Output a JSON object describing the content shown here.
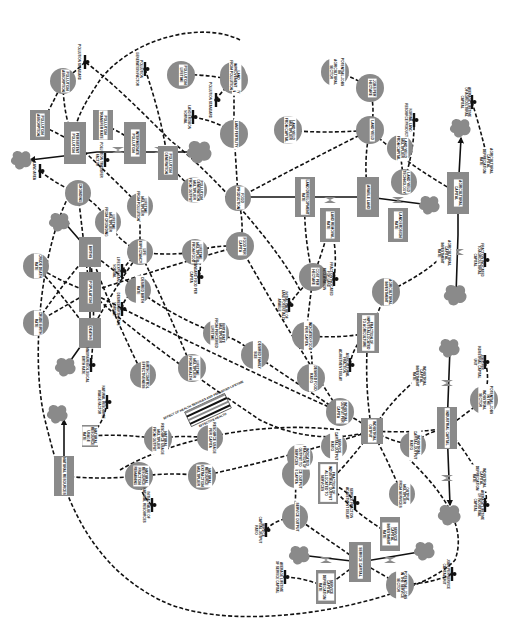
{
  "diagram": {
    "orientation": "rotated 90 degrees clockwise",
    "colors": {
      "node_fill": "#8a8a8a",
      "line": "#111111",
      "background": "#ffffff",
      "label_bg": "#ffffff"
    },
    "levels": [
      {
        "id": "population",
        "label": "POPULATION",
        "x": 90,
        "y": 292,
        "w": 22,
        "h": 40
      },
      {
        "id": "births",
        "label": "BIRTHS",
        "x": 90,
        "y": 252,
        "w": 22,
        "h": 30
      },
      {
        "id": "deaths",
        "label": "DEATHS",
        "x": 90,
        "y": 333,
        "w": 22,
        "h": 30
      },
      {
        "id": "persistent-pollution",
        "label": "PERSISTENT POLLUTION",
        "x": 75,
        "y": 143,
        "w": 22,
        "h": 42
      },
      {
        "id": "pollution-absorption",
        "label": "POLLUTION ABSORPTION",
        "x": 40,
        "y": 125,
        "w": 20,
        "h": 30
      },
      {
        "id": "pollution-transfer-rate",
        "label": "POLLUTION TRANSFER RATE",
        "x": 103,
        "y": 125,
        "w": 20,
        "h": 30
      },
      {
        "id": "intermediate-pollution",
        "label": "INTERMEDIATE POLLUTION",
        "x": 135,
        "y": 143,
        "w": 22,
        "h": 42
      },
      {
        "id": "pollution-generation",
        "label": "POLLUTION GENERATION",
        "x": 168,
        "y": 163,
        "w": 20,
        "h": 34
      },
      {
        "id": "land-development-rate",
        "label": "LAND DEVELOPMENT RATE",
        "x": 305,
        "y": 197,
        "w": 20,
        "h": 40
      },
      {
        "id": "land-removal-rate",
        "label": "LAND REMOVAL RATE",
        "x": 330,
        "y": 225,
        "w": 20,
        "h": 34
      },
      {
        "id": "arable-land",
        "label": "ARABLE LAND",
        "x": 368,
        "y": 197,
        "w": 22,
        "h": 40
      },
      {
        "id": "land-erosion-rate",
        "label": "LAND EROSION RATE",
        "x": 398,
        "y": 225,
        "w": 20,
        "h": 34
      },
      {
        "id": "agricultural-capital",
        "label": "AGRICULTURAL CAPITAL",
        "x": 458,
        "y": 193,
        "w": 22,
        "h": 42
      },
      {
        "id": "agricultural-capital-depreciation-rate",
        "label": "AGRICULTURAL CAPITAL DEPRECIATION RATE",
        "x": 488,
        "y": 161,
        "w": 16,
        "h": 22
      },
      {
        "id": "agricultural-capital-investment-rate",
        "label": "AGRICULTURAL CAPITAL INVESTMENT RATE",
        "x": 446,
        "y": 253,
        "w": 16,
        "h": 22
      },
      {
        "id": "fraction-of-inputs-allocated-to-agriculture",
        "label": "FRACTION OF INPUTS ALLOCATED TO AGRICULTURE",
        "x": 368,
        "y": 333,
        "w": 22,
        "h": 40
      },
      {
        "id": "industrial-capital",
        "label": "INDUSTRIAL CAPITAL",
        "x": 447,
        "y": 428,
        "w": 20,
        "h": 42
      },
      {
        "id": "industrial-capital-investment-rate",
        "label": "INDUSTRIAL CAPITAL INVESTMENT RATE",
        "x": 421,
        "y": 376,
        "w": 16,
        "h": 22
      },
      {
        "id": "industrial-capital-depreciation-rate",
        "label": "INDUSTRIAL CAPITAL DEPRECIATION RATE",
        "x": 481,
        "y": 478,
        "w": 16,
        "h": 22
      },
      {
        "id": "industrial-output",
        "label": "INDUSTRIAL OUTPUT",
        "x": 372,
        "y": 431,
        "w": 22,
        "h": 26
      },
      {
        "id": "service-capital",
        "label": "SERVICE CAPITAL",
        "x": 360,
        "y": 562,
        "w": 22,
        "h": 40
      },
      {
        "id": "service-capital-investment-rate",
        "label": "SERVICE CAPITAL INVESTMENT RATE",
        "x": 390,
        "y": 534,
        "w": 20,
        "h": 34
      },
      {
        "id": "service-capital-depreciation-rate",
        "label": "SERVICE CAPITAL DEPRECIATION RATE",
        "x": 326,
        "y": 587,
        "w": 20,
        "h": 34
      },
      {
        "id": "fraction-of-industrial-output-allocated-to-services",
        "label": "FRACTION OF INDUSTRIAL OUTPUT ALLOCATED TO SERVICES",
        "x": 328,
        "y": 483,
        "w": 20,
        "h": 42
      },
      {
        "id": "natural-resources",
        "label": "NATURAL RESOURCES",
        "x": 64,
        "y": 476,
        "w": 20,
        "h": 40
      },
      {
        "id": "natural-resource-usage-rate",
        "label": "NATURAL RESOURCE USAGE RATE",
        "x": 90,
        "y": 436,
        "w": 16,
        "h": 22
      }
    ],
    "auxiliaries": [
      {
        "id": "crude-death-rate",
        "label": "CRUDE DEATH RATE",
        "x": 36,
        "y": 266,
        "r": 13
      },
      {
        "id": "crude-birth-rate",
        "label": "CRUDE BIRTH RATE",
        "x": 36,
        "y": 323,
        "r": 13
      },
      {
        "id": "crowding",
        "label": "CROWDING",
        "x": 78,
        "y": 193,
        "r": 13
      },
      {
        "id": "lifetime-multiplier-from-crowding",
        "label": "LIFETIME MULTIPLIER FROM CROWDING",
        "x": 108,
        "y": 222,
        "r": 13
      },
      {
        "id": "lifetime-multiplier-from-pollution",
        "label": "LIFETIME MULTIPLIER FROM POLLUTION",
        "x": 140,
        "y": 206,
        "r": 13
      },
      {
        "id": "life-expectancy",
        "label": "LIFE EXPECTANCY",
        "x": 140,
        "y": 252,
        "r": 13
      },
      {
        "id": "desired-birth-rate",
        "label": "DESIRED BIRTH RATE",
        "x": 138,
        "y": 290,
        "r": 13
      },
      {
        "id": "birth-control-effectiveness",
        "label": "BIRTH CONTROL EFFECTIVENESS",
        "x": 143,
        "y": 375,
        "r": 13
      },
      {
        "id": "lifetime-multiplier-from-food",
        "label": "LIFETIME MULTIPLIER FROM FOOD",
        "x": 195,
        "y": 252,
        "r": 13
      },
      {
        "id": "food-per-capita",
        "label": "FOOD PER CAPITA",
        "x": 240,
        "y": 246,
        "r": 14
      },
      {
        "id": "food-production",
        "label": "FOOD PRODUCTION",
        "x": 238,
        "y": 198,
        "r": 13
      },
      {
        "id": "pollution-generation-multiplier-from-output",
        "label": "POLLUTION GENERATION MULTIPLIER FROM OUTPUT",
        "x": 194,
        "y": 190,
        "r": 13
      },
      {
        "id": "land-fertility",
        "label": "LAND FERTILITY",
        "x": 234,
        "y": 134,
        "r": 14
      },
      {
        "id": "land-fertility-degradation",
        "label": "LAND FERTILITY DEGRADATION",
        "x": 234,
        "y": 80,
        "r": 14
      },
      {
        "id": "land-improvement-from-pollution",
        "label": "LAND IMPROVEMENT FROM POLLUTION",
        "x": 233,
        "y": 75,
        "r": 13
      },
      {
        "id": "pollution-lifetime",
        "label": "POLLUTION LIFETIME",
        "x": 181,
        "y": 75,
        "r": 14
      },
      {
        "id": "pollution-absorption-rate",
        "label": "POLLUTION ABSORPTION",
        "x": 63,
        "y": 81,
        "r": 13
      },
      {
        "id": "land-yield-multiplier-from-capital",
        "label": "LAND YIELD MULTIPLIER FROM CAPITAL",
        "x": 288,
        "y": 130,
        "r": 14
      },
      {
        "id": "land-yield",
        "label": "LAND YIELD",
        "x": 370,
        "y": 130,
        "r": 14
      },
      {
        "id": "potential-jobs-agricultural-sector",
        "label": "POTENTIAL JOBS IN AGRICULTURAL SECTOR",
        "x": 335,
        "y": 72,
        "r": 14
      },
      {
        "id": "jobs-per-hectare",
        "label": "JOBS PER HECTARE",
        "x": 370,
        "y": 88,
        "r": 14
      },
      {
        "id": "land-yield-multiplier-from-capital-2",
        "label": "LAND YIELD MULTIPLIER FROM CAPITAL",
        "x": 400,
        "y": 148,
        "r": 13
      },
      {
        "id": "land-yield-technology",
        "label": "LAND YIELD TECHNOLOGY",
        "x": 404,
        "y": 182,
        "r": 13
      },
      {
        "id": "cost-per-hectare",
        "label": "COST PER HECTARE",
        "x": 313,
        "y": 277,
        "r": 14
      },
      {
        "id": "agricultural-investment",
        "label": "AGRICULTURAL INVESTMENT",
        "x": 386,
        "y": 292,
        "r": 14
      },
      {
        "id": "indicated-food-per-capita",
        "label": "INDICATED FOOD PER CAPITA",
        "x": 306,
        "y": 336,
        "r": 14
      },
      {
        "id": "desired-food-ratio",
        "label": "DESIRED FOOD RATIO",
        "x": 311,
        "y": 378,
        "r": 14
      },
      {
        "id": "birth-rate-multiplier-from-perceived-lifetime",
        "label": "BIRTH RATE MULTIPLIER FROM PERCEIVED LIFETIME",
        "x": 216,
        "y": 333,
        "r": 13
      },
      {
        "id": "desired-family-size",
        "label": "DESIRED FAMILY SIZE",
        "x": 255,
        "y": 355,
        "r": 14
      },
      {
        "id": "lifetime-multiplier-from-health",
        "label": "LIFETIME MULTIPLIER FROM HEALTH",
        "x": 192,
        "y": 368,
        "r": 14
      },
      {
        "id": "industrial-output-per-capita",
        "label": "INDUSTRIAL OUTPUT PER CAPITA",
        "x": 340,
        "y": 412,
        "r": 14
      },
      {
        "id": "industrial-capital-output-ratio",
        "label": "INDUSTRIAL CAPITAL-OUTPUT RATIO",
        "x": 413,
        "y": 445,
        "r": 13
      },
      {
        "id": "potential-jobs-industrial-sector",
        "label": "POTENTIAL JOBS IN THE INDUSTRIAL SECTOR",
        "x": 484,
        "y": 400,
        "r": 14
      },
      {
        "id": "service-output-per-capita",
        "label": "SERVICE OUTPUT PER CAPITA",
        "x": 296,
        "y": 474,
        "r": 14
      },
      {
        "id": "service-output",
        "label": "SERVICE OUTPUT",
        "x": 295,
        "y": 517,
        "r": 13
      },
      {
        "id": "indicated-fraction-to-services",
        "label": "INDICATED FRACTION OF OUTPUT TO SERVICES",
        "x": 300,
        "y": 457,
        "r": 13
      },
      {
        "id": "output-multiplier-from-services",
        "label": "OUTPUT MULTIPLIER FROM SERVICES",
        "x": 402,
        "y": 494,
        "r": 13
      },
      {
        "id": "growth-resources-per-capita",
        "label": "RESOURCE USAGE PER CAPITA",
        "x": 210,
        "y": 438,
        "r": 13
      },
      {
        "id": "natural-resource-usage-multiplier",
        "label": "NATURAL RESOURCE USAGE MULTIPLIER FROM OUTPUT",
        "x": 158,
        "y": 439,
        "r": 14
      },
      {
        "id": "natural-resource-fraction-remaining",
        "label": "NATURAL RESOURCE FRACTION REMAINING",
        "x": 139,
        "y": 476,
        "r": 14
      },
      {
        "id": "natural-resource-extraction-multiplier",
        "label": "NATURAL RESOURCE EXTRACTION MULTIPLIER",
        "x": 202,
        "y": 476,
        "r": 14
      },
      {
        "id": "potential-jobs-service-sector",
        "label": "POTENTIAL JOBS IN THE SERVICE SECTOR",
        "x": 400,
        "y": 585,
        "r": 14
      },
      {
        "id": "industrial-capital-output-ratio-2",
        "label": "SERVICE CAPITAL-OUTPUT RATIO",
        "x": 334,
        "y": 446,
        "r": 13
      }
    ],
    "constants": [
      {
        "id": "pollution-standard",
        "label": "POLLUTION STANDARD",
        "x": 85,
        "y": 62
      },
      {
        "id": "pollution-generation-factor",
        "label": "POLLUTION GENERATION FACTOR",
        "x": 145,
        "y": 69
      },
      {
        "id": "pollution-standard-2",
        "label": "POLLUTION STANDARD",
        "x": 216,
        "y": 100
      },
      {
        "id": "land-erosion-normal",
        "label": "LAND EROSION NORMAL",
        "x": 193,
        "y": 117
      },
      {
        "id": "pollution-transfer-factor",
        "label": "POLLUTION TRANSFER FACTOR",
        "x": 105,
        "y": 160
      },
      {
        "id": "land-area",
        "label": "LAND AREA",
        "x": 40,
        "y": 171
      },
      {
        "id": "normal-land-resource-product",
        "label": "NORMAL LAND RESOURCE PRODUCT",
        "x": 414,
        "y": 120
      },
      {
        "id": "average-lifetime-agricultural-capital",
        "label": "AVERAGE LIFETIME OF AGRICULTURAL CAPITAL",
        "x": 472,
        "y": 102
      },
      {
        "id": "standard-food-per-capita",
        "label": "STANDARD FOOD PER CAPITA",
        "x": 199,
        "y": 277
      },
      {
        "id": "desired-birth-rate-normal",
        "label": "DESIRED BIRTH RATE NORMAL",
        "x": 122,
        "y": 309
      },
      {
        "id": "life-expectancy-normal",
        "label": "LIFE EXPECTANCY NORMAL",
        "x": 122,
        "y": 271
      },
      {
        "id": "maximum-biological-birth-rate",
        "label": "MAXIMUM BIOLOGICAL BIRTH RATE",
        "x": 91,
        "y": 365
      },
      {
        "id": "natural-resource-usage-factor",
        "label": "NATURAL RESOURCE USAGE FACTOR",
        "x": 107,
        "y": 402
      },
      {
        "id": "initial-value-natural-resources",
        "label": "INITIAL VALUE OF NATURAL RESOURCES",
        "x": 152,
        "y": 505
      },
      {
        "id": "fraction-indicated-land-reclamation",
        "label": "FRACTION INDICATED FOR LAND RECLAMATION",
        "x": 334,
        "y": 279
      },
      {
        "id": "initial-value-land-potentially-arable",
        "label": "INITIAL VALUE OF LAND POTENTIALLY ARABLE",
        "x": 289,
        "y": 305
      },
      {
        "id": "agricultural-fraction-adjustment-delay",
        "label": "AGRICULTURAL FRACTION ADJUSTMENT DELAY",
        "x": 350,
        "y": 365
      },
      {
        "id": "fraction-inputs-to-agricultural-capital",
        "label": "FRACTION INDICATED TO AGRICULTURAL CAPITAL",
        "x": 485,
        "y": 260
      },
      {
        "id": "jobs-per-industrial-capital-unit",
        "label": "JOBS PER INDUSTRIAL CAPITAL UNIT",
        "x": 485,
        "y": 362
      },
      {
        "id": "average-lifetime-industrial-capital",
        "label": "AVERAGE LIFETIME OF INDUSTRIAL CAPITAL",
        "x": 485,
        "y": 505
      },
      {
        "id": "service-fraction-adjustment-delay",
        "label": "SERVICE FRACTION ADJUSTMENT DELAY",
        "x": 355,
        "y": 503
      },
      {
        "id": "service-capital-output-ratio",
        "label": "SERVICE CAPITAL-OUTPUT RATIO",
        "x": 266,
        "y": 530
      },
      {
        "id": "average-lifetime-service-capital",
        "label": "AVERAGE LIFETIME OF SERVICE CAPITAL",
        "x": 285,
        "y": 577
      },
      {
        "id": "jobs-per-service-capital-unit",
        "label": "JOBS PER SERVICE CAPITAL UNIT",
        "x": 452,
        "y": 574
      }
    ],
    "special": {
      "label": "EFFECT OF HEALTH SERVICES AND PERCEIVED LIFETIME",
      "sublabel": "EFFECTIVE HEALTH",
      "x": 208,
      "y": 410
    },
    "clouds": [
      {
        "id": "cloud-pollution-sink",
        "x": 22,
        "y": 160,
        "s": 1
      },
      {
        "id": "cloud-pollution-source",
        "x": 200,
        "y": 152,
        "s": 1.2
      },
      {
        "id": "cloud-births",
        "x": 60,
        "y": 222,
        "s": 1
      },
      {
        "id": "cloud-deaths",
        "x": 66,
        "y": 367,
        "s": 1
      },
      {
        "id": "cloud-natural-resources",
        "x": 58,
        "y": 414,
        "s": 1
      },
      {
        "id": "cloud-land-erosion",
        "x": 430,
        "y": 205,
        "s": 1
      },
      {
        "id": "cloud-land-source",
        "x": 225,
        "y": 195,
        "s": 0
      },
      {
        "id": "cloud-agcap-depreciation",
        "x": 461,
        "y": 128,
        "s": 1
      },
      {
        "id": "cloud-agcap-investment",
        "x": 456,
        "y": 295,
        "s": 1.1
      },
      {
        "id": "cloud-indcap-investment",
        "x": 450,
        "y": 348,
        "s": 1
      },
      {
        "id": "cloud-indcap-depreciation",
        "x": 450,
        "y": 515,
        "s": 1.1
      },
      {
        "id": "cloud-servcap-investment",
        "x": 425,
        "y": 551,
        "s": 1
      },
      {
        "id": "cloud-servcap-depreciation",
        "x": 300,
        "y": 555,
        "s": 1
      }
    ]
  }
}
